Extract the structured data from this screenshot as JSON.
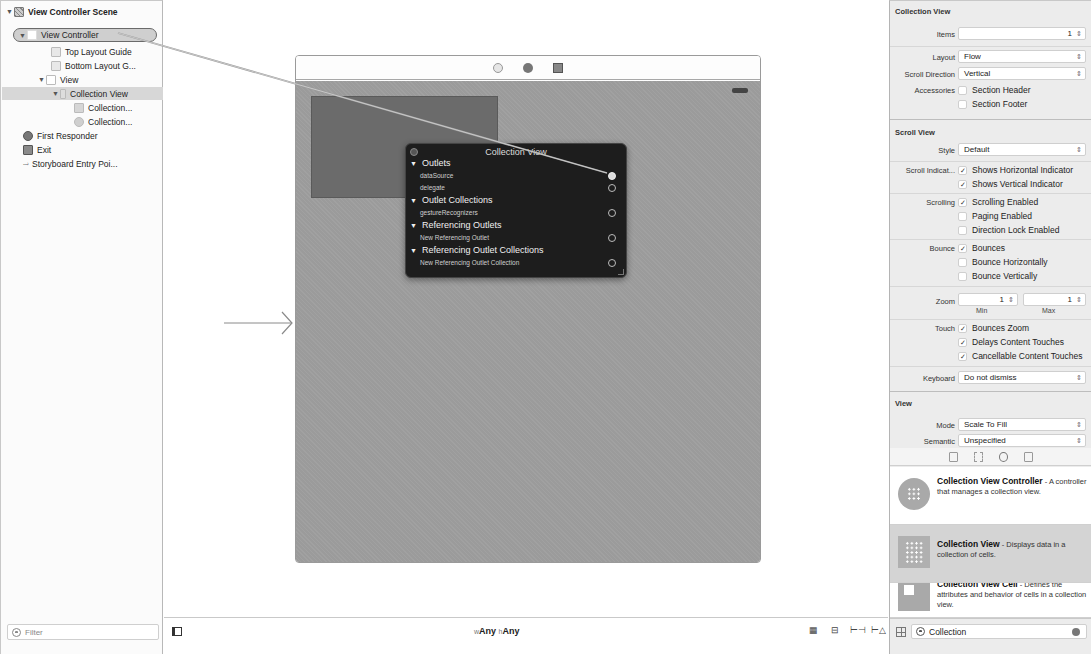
{
  "outline": {
    "items": [
      {
        "label": "View Controller Scene",
        "level": 0,
        "icon": "scene-icon",
        "expanded": true
      },
      {
        "label": "View Controller",
        "level": 1,
        "icon": "view-controller-icon",
        "expanded": true,
        "selected_outline": true
      },
      {
        "label": "Top Layout Guide",
        "level": 2,
        "icon": "layout-guide-icon"
      },
      {
        "label": "Bottom Layout G...",
        "level": 2,
        "icon": "layout-guide-icon"
      },
      {
        "label": "View",
        "level": 2,
        "icon": "view-icon",
        "expanded": true
      },
      {
        "label": "Collection View",
        "level": 3,
        "icon": "collection-view-icon",
        "expanded": true,
        "highlighted": true
      },
      {
        "label": "Collection...",
        "level": 4,
        "icon": "collection-cell-icon"
      },
      {
        "label": "Collection...",
        "level": 4,
        "icon": "collection-layout-icon"
      },
      {
        "label": "First Responder",
        "level": 1,
        "icon": "first-responder-icon"
      },
      {
        "label": "Exit",
        "level": 1,
        "icon": "exit-icon"
      },
      {
        "label": "Storyboard Entry Poi...",
        "level": 1,
        "icon": "entry-arrow-icon"
      }
    ],
    "filter_placeholder": "Filter"
  },
  "canvas": {
    "dock_icons": [
      "view-controller-icon",
      "first-responder-icon",
      "exit-icon"
    ],
    "size_class": {
      "w_prefix": "w",
      "w_value": "Any",
      "h_prefix": "h",
      "h_value": "Any"
    },
    "bar_tools": [
      "embed-in-icon",
      "align-icon",
      "pin-icon",
      "resolve-issues-icon"
    ]
  },
  "outlet_popover": {
    "title": "Collection View",
    "sections": [
      {
        "label": "Outlets",
        "items": [
          {
            "label": "dataSource",
            "connected": true
          },
          {
            "label": "delegate",
            "connected": false
          }
        ]
      },
      {
        "label": "Outlet Collections",
        "items": [
          {
            "label": "gestureRecognizers",
            "connected": false
          }
        ]
      },
      {
        "label": "Referencing Outlets",
        "items": [
          {
            "label": "New Referencing Outlet",
            "connected": false
          }
        ]
      },
      {
        "label": "Referencing Outlet Collections",
        "items": [
          {
            "label": "New Referencing Outlet Collection",
            "connected": false
          }
        ]
      }
    ]
  },
  "inspector": {
    "collection_view": {
      "header": "Collection View",
      "items_label": "Items",
      "items_value": "1",
      "layout_label": "Layout",
      "layout_value": "Flow",
      "scroll_direction_label": "Scroll Direction",
      "scroll_direction_value": "Vertical",
      "accessories_label": "Accessories",
      "section_header": {
        "label": "Section Header",
        "checked": false
      },
      "section_footer": {
        "label": "Section Footer",
        "checked": false
      }
    },
    "scroll_view": {
      "header": "Scroll View",
      "style_label": "Style",
      "style_value": "Default",
      "indicators_label": "Scroll Indicat...",
      "shows_horizontal": {
        "label": "Shows Horizontal Indicator",
        "checked": true
      },
      "shows_vertical": {
        "label": "Shows Vertical Indicator",
        "checked": true
      },
      "scrolling_label": "Scrolling",
      "scrolling_enabled": {
        "label": "Scrolling Enabled",
        "checked": true
      },
      "paging_enabled": {
        "label": "Paging Enabled",
        "checked": false
      },
      "direction_lock": {
        "label": "Direction Lock Enabled",
        "checked": false
      },
      "bounce_label": "Bounce",
      "bounces": {
        "label": "Bounces",
        "checked": true
      },
      "bounce_horizontally": {
        "label": "Bounce Horizontally",
        "checked": false
      },
      "bounce_vertically": {
        "label": "Bounce Vertically",
        "checked": false
      },
      "zoom_label": "Zoom",
      "zoom_min": "1",
      "zoom_max": "1",
      "min_label": "Min",
      "max_label": "Max",
      "touch_label": "Touch",
      "bounces_zoom": {
        "label": "Bounces Zoom",
        "checked": true
      },
      "delays_content_touches": {
        "label": "Delays Content Touches",
        "checked": true
      },
      "cancellable_content_touches": {
        "label": "Cancellable Content Touches",
        "checked": true
      },
      "keyboard_label": "Keyboard",
      "keyboard_value": "Do not dismiss"
    },
    "view": {
      "header": "View",
      "mode_label": "Mode",
      "mode_value": "Scale To Fill",
      "semantic_label": "Semantic",
      "semantic_value": "Unspecified"
    },
    "check_mark": "✓",
    "stepper_glyph": "⇕",
    "popup_glyph": "⇕"
  },
  "library": {
    "tabs": [
      "file-template-icon",
      "code-snippet-icon",
      "object-library-icon",
      "media-library-icon"
    ],
    "items": [
      {
        "title": "Collection View Controller",
        "desc": " - A controller that manages a collection view.",
        "selected": false
      },
      {
        "title": "Collection View",
        "desc": " - Displays data in a collection of cells.",
        "selected": true
      },
      {
        "title": "Collection View Cell",
        "desc": " - Defines the attributes and behavior of cells in a collection view.",
        "selected": false
      }
    ],
    "filter_value": "Collection"
  }
}
